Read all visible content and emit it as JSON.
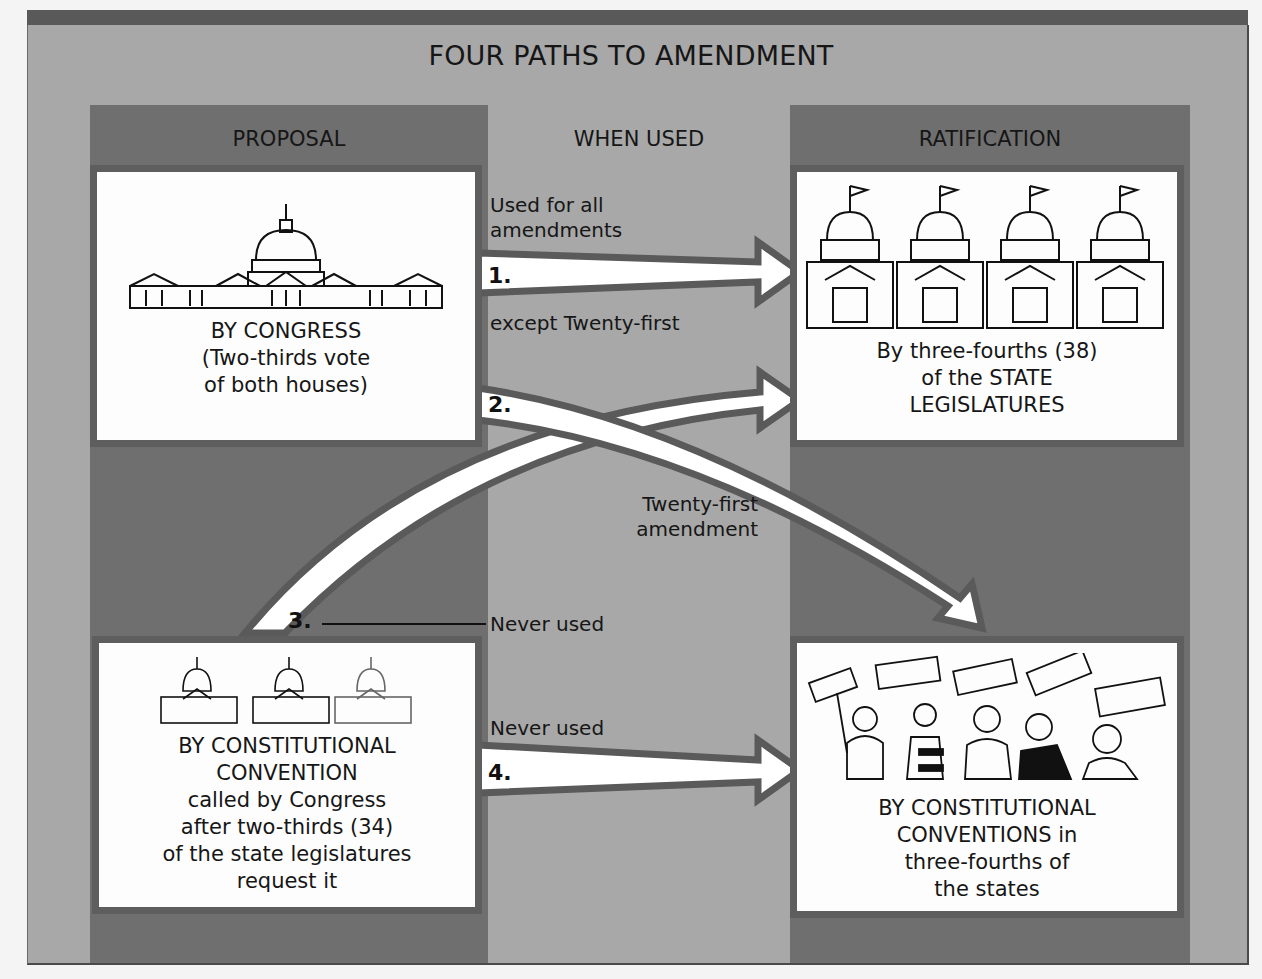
{
  "title": "FOUR PATHS TO AMENDMENT",
  "columns": {
    "proposal": "PROPOSAL",
    "when_used": "WHEN USED",
    "ratification": "RATIFICATION"
  },
  "proposal_boxes": [
    {
      "icon": "capitol-building-icon",
      "lines": [
        "BY CONGRESS",
        "(Two-thirds vote",
        "of both houses)"
      ]
    },
    {
      "icon": "three-capitols-icon",
      "lines": [
        "BY CONSTITUTIONAL",
        "CONVENTION",
        "called by Congress",
        "after two-thirds (34)",
        "of the state legislatures",
        "request it"
      ]
    }
  ],
  "ratification_boxes": [
    {
      "icon": "four-state-capitols-icon",
      "lines": [
        "By three-fourths (38)",
        "of the STATE",
        "LEGISLATURES"
      ]
    },
    {
      "icon": "protesters-with-signs-icon",
      "lines": [
        "BY CONSTITUTIONAL",
        "CONVENTIONS in",
        "three-fourths of",
        "the states"
      ]
    }
  ],
  "paths": [
    {
      "number": "1.",
      "note_above": [
        "Used for all",
        "amendments"
      ],
      "note_below": "except Twenty-first"
    },
    {
      "number": "2.",
      "note": [
        "Twenty-first",
        "amendment"
      ]
    },
    {
      "number": "3.",
      "note": "Never used"
    },
    {
      "number": "4.",
      "note": "Never used"
    }
  ],
  "colors": {
    "panel_light": "#a8a8a8",
    "column_dark": "#6f6f6f",
    "box_border": "#5e5e5e",
    "box_fill": "#fdfdfd",
    "arrow_fill": "#ffffff",
    "arrow_outline": "#5a5a5a"
  }
}
